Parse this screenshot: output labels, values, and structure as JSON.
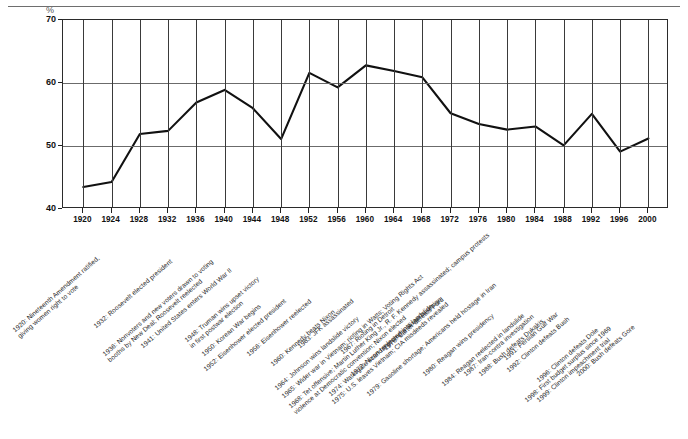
{
  "axis": {
    "y_unit": "%",
    "y_ticks": [
      "40",
      "50",
      "60",
      "70"
    ],
    "y_min": 40,
    "y_max": 70,
    "x_ticks": [
      "1920",
      "1924",
      "1928",
      "1932",
      "1936",
      "1940",
      "1944",
      "1948",
      "1952",
      "1956",
      "1960",
      "1964",
      "1968",
      "1972",
      "1976",
      "1980",
      "1984",
      "1988",
      "1992",
      "1996",
      "2000"
    ]
  },
  "annotations": [
    {
      "id": "a1920",
      "text": "1920: Nineteenth Amendment ratified,",
      "text2": "giving women right to vote"
    },
    {
      "id": "a1932",
      "text": "1932: Roosevelt elected president"
    },
    {
      "id": "a1936",
      "text": "1936: Nonvoters and new voters drawn to voting",
      "text2": "booths by New Deal; Roosevelt reelected"
    },
    {
      "id": "a1941",
      "text": "1941: United States enters World War II"
    },
    {
      "id": "a1948",
      "text": "1948: Truman wins upset victory",
      "text2": "in first postwar election"
    },
    {
      "id": "a1950",
      "text": "1950: Korean War begins"
    },
    {
      "id": "a1952",
      "text": "1952: Eisenhower elected president"
    },
    {
      "id": "a1956",
      "text": "1956: Eisenhower reelected"
    },
    {
      "id": "a1960",
      "text": "1960: Kennedy beats Nixon"
    },
    {
      "id": "a1963",
      "text": "1963: JFK assassinated"
    },
    {
      "id": "a1964",
      "text": "1964: Johnson wins landslide victory"
    },
    {
      "id": "a1965",
      "text": "1965: Wider war in Vietnam; rioting in Watts; Voting Rights Act"
    },
    {
      "id": "a1967",
      "text": "1967: Rioting in Detroit"
    },
    {
      "id": "a1968",
      "text": "1968: Tet offensive; Martin Luther King Jr., R. F. Kennedy assassinated; campus protests",
      "text2": "violence at Democratic convention; Nixon elected"
    },
    {
      "id": "a1972",
      "text": "1972: Nixon reelected in a landslide"
    },
    {
      "id": "a1974",
      "text": "1974: Watergate scandal prompts Nixon to resign"
    },
    {
      "id": "a1975",
      "text": "1975: U.S. leaves Vietnam; CIA misdeeds revealed"
    },
    {
      "id": "a1976",
      "text": "1976: Carter defeats Ford"
    },
    {
      "id": "a1979",
      "text": "1979: Gasoline shortage; Americans held hostage in Iran"
    },
    {
      "id": "a1980",
      "text": "1980: Reagan wins presidency"
    },
    {
      "id": "a1984",
      "text": "1984: Reagan reelected in landslide"
    },
    {
      "id": "a1987",
      "text": "1987: Iran-contra investigation"
    },
    {
      "id": "a1988",
      "text": "1988: Bush defeats Dukakis"
    },
    {
      "id": "a1991",
      "text": "1991: Persian Gulf War"
    },
    {
      "id": "a1992",
      "text": "1992: Clinton defeats Bush"
    },
    {
      "id": "a1996",
      "text": "1996: Clinton defeats Dole"
    },
    {
      "id": "a1998",
      "text": "1998: First budget surplus since 1969"
    },
    {
      "id": "a1999",
      "text": "1999: Clinton impeachment trial"
    },
    {
      "id": "a2000",
      "text": "2000: Bush defeats Gore"
    }
  ],
  "chart_data": {
    "type": "line",
    "title": "",
    "xlabel": "",
    "ylabel": "%",
    "ylim": [
      40,
      70
    ],
    "xlim": [
      1920,
      2000
    ],
    "grid": true,
    "legend": "none",
    "categories": [
      1920,
      1924,
      1928,
      1932,
      1936,
      1940,
      1944,
      1948,
      1952,
      1956,
      1960,
      1964,
      1968,
      1972,
      1976,
      1980,
      1984,
      1988,
      1992,
      1996,
      2000
    ],
    "values": [
      43.5,
      44.3,
      51.9,
      52.4,
      56.9,
      58.9,
      56.0,
      51.1,
      61.6,
      59.3,
      62.8,
      61.9,
      60.9,
      55.2,
      53.5,
      52.6,
      53.1,
      50.1,
      55.1,
      49.1,
      51.2
    ],
    "series": [
      {
        "name": "Voter turnout",
        "values": [
          43.5,
          44.3,
          51.9,
          52.4,
          56.9,
          58.9,
          56.0,
          51.1,
          61.6,
          59.3,
          62.8,
          61.9,
          60.9,
          55.2,
          53.5,
          52.6,
          53.1,
          50.1,
          55.1,
          49.1,
          51.2
        ]
      }
    ]
  }
}
